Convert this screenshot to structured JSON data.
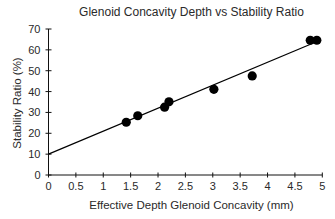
{
  "chart_data": {
    "type": "scatter",
    "title": "Glenoid Concavity Depth vs Stability Ratio",
    "xlabel": "Effective Depth Glenoid Concavity (mm)",
    "ylabel": "Stability Ratio (%)",
    "xlim": [
      0,
      5
    ],
    "ylim": [
      0,
      70
    ],
    "x_ticks": [
      0,
      0.5,
      1,
      1.5,
      2,
      2.5,
      3,
      3.5,
      4,
      4.5,
      5
    ],
    "x_tick_labels": [
      "0",
      "0.5",
      "1",
      "1.5",
      "2",
      "2.5",
      "3",
      "3.5",
      "4",
      "4.5",
      "5"
    ],
    "y_ticks": [
      0,
      10,
      20,
      30,
      40,
      50,
      60,
      70
    ],
    "y_tick_labels": [
      "0",
      "10",
      "20",
      "30",
      "40",
      "50",
      "60",
      "70"
    ],
    "grid": false,
    "legend": null,
    "series": [
      {
        "name": "Measurements",
        "marker": "filled-circle",
        "color": "#000000",
        "points": [
          {
            "x": 1.42,
            "y": 25.3
          },
          {
            "x": 1.63,
            "y": 28.4
          },
          {
            "x": 2.12,
            "y": 32.5
          },
          {
            "x": 2.2,
            "y": 35.1
          },
          {
            "x": 3.02,
            "y": 41.1
          },
          {
            "x": 3.72,
            "y": 47.5
          },
          {
            "x": 4.78,
            "y": 64.6
          },
          {
            "x": 4.9,
            "y": 64.6
          }
        ]
      }
    ],
    "trendline": {
      "type": "linear",
      "color": "#000000",
      "from": {
        "x": 0,
        "y": 10
      },
      "to": {
        "x": 4.85,
        "y": 63.4
      }
    }
  }
}
